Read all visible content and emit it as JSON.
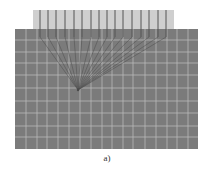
{
  "figure": {
    "caption": "a)",
    "colors": {
      "background": "#ffffff",
      "medium": "#7b7b7b",
      "grid_line": "#b9b9b9",
      "transducer_band": "#cfcfcf",
      "element_line": "#555555",
      "ray": "#4a4a4a"
    },
    "transducer_band": {
      "x": 33,
      "y": 10,
      "width": 141,
      "height": 20
    },
    "medium_region": {
      "x": 15,
      "y": 29,
      "width": 183,
      "height": 120
    },
    "elements_x": [
      40,
      48,
      56,
      65,
      74,
      82,
      91,
      99,
      107,
      115,
      123,
      132,
      141,
      149,
      158,
      166
    ],
    "element_y_top": 10,
    "element_y_bottom": 37,
    "focal_point": {
      "x": 78,
      "y": 90
    },
    "grid_vertical_x": [
      26,
      37,
      47,
      58,
      69,
      80,
      91,
      102,
      112,
      123,
      133,
      145,
      156,
      167,
      177,
      188
    ],
    "grid_horizontal_y": [
      40,
      52,
      63,
      75,
      88,
      101,
      113,
      126,
      137
    ]
  }
}
